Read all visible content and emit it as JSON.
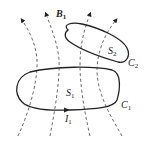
{
  "diagram": {
    "labels": {
      "field": "B",
      "field_sub": "1",
      "surface2": "S",
      "surface2_sub": "2",
      "loop2": "C",
      "loop2_sub": "2",
      "surface1": "S",
      "surface1_sub": "1",
      "loop1": "C",
      "loop1_sub": "1",
      "current": "I",
      "current_sub": "1"
    },
    "colors": {
      "stroke": "#222222",
      "background": "#ffffff"
    }
  }
}
